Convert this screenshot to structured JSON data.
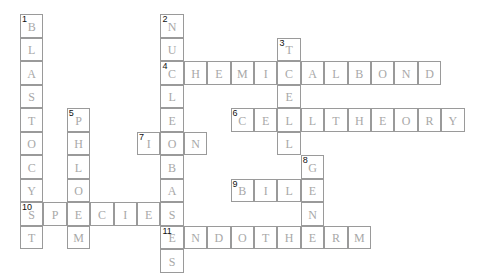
{
  "puzzle": {
    "grid": {
      "origin_x": 20,
      "origin_y": 14,
      "cell_w": 23.4,
      "cell_h": 23.5
    },
    "entries": [
      {
        "number": "1",
        "direction": "down",
        "row": 0,
        "col": 0,
        "answer": "BLASTOCYST"
      },
      {
        "number": "2",
        "direction": "down",
        "row": 0,
        "col": 6,
        "answer": "NUCLEOBASES"
      },
      {
        "number": "3",
        "direction": "down",
        "row": 1,
        "col": 11,
        "answer": "TCELL"
      },
      {
        "number": "4",
        "direction": "across",
        "row": 2,
        "col": 6,
        "answer": "CHEMICALBOND"
      },
      {
        "number": "5",
        "direction": "down",
        "row": 4,
        "col": 2,
        "answer": "PHLOEM"
      },
      {
        "number": "6",
        "direction": "across",
        "row": 4,
        "col": 9,
        "answer": "CELLTHEORY"
      },
      {
        "number": "7",
        "direction": "across",
        "row": 5,
        "col": 5,
        "answer": "ION"
      },
      {
        "number": "8",
        "direction": "down",
        "row": 6,
        "col": 12,
        "answer": "GENE"
      },
      {
        "number": "9",
        "direction": "across",
        "row": 7,
        "col": 9,
        "answer": "BILE"
      },
      {
        "number": "10",
        "direction": "across",
        "row": 8,
        "col": 0,
        "answer": "SPECIES"
      },
      {
        "number": "11",
        "direction": "across",
        "row": 9,
        "col": 6,
        "answer": "ENDOTHERM"
      }
    ]
  },
  "colors": {
    "border": "#9a9a9a",
    "letter": "#a8a8a8",
    "number": "#111111"
  }
}
